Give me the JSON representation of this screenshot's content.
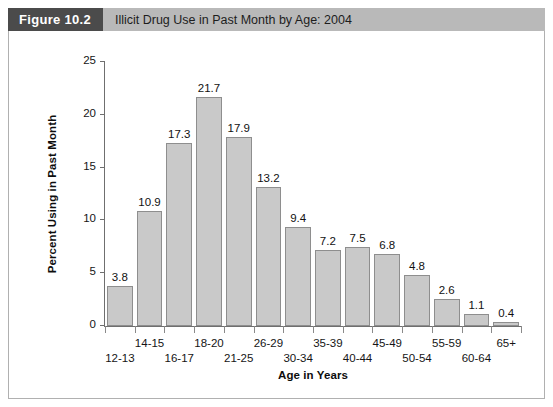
{
  "figure": {
    "tag": "Figure 10.2",
    "caption": "Illicit Drug Use in Past Month by Age: 2004"
  },
  "colors": {
    "tag_background": "#4b4b4b",
    "caption_background": "#b9b9b9",
    "bar_fill": "#c9c9c9",
    "bar_outline": "#8e8e8e",
    "axis": "#6f6f6f",
    "frame_border": "#b0b0b0"
  },
  "chart_data": {
    "type": "bar",
    "title": "Illicit Drug Use in Past Month by Age: 2004",
    "xlabel": "Age in Years",
    "ylabel": "Percent Using in Past Month",
    "ylim": [
      0,
      25
    ],
    "yticks": [
      0,
      5,
      10,
      15,
      20,
      25
    ],
    "ytick_labels": [
      "0",
      "5",
      "10",
      "15",
      "20",
      "25"
    ],
    "grid": false,
    "legend": "none",
    "categories": [
      "12-13",
      "14-15",
      "16-17",
      "18-20",
      "21-25",
      "26-29",
      "30-34",
      "35-39",
      "40-44",
      "45-49",
      "50-54",
      "55-59",
      "60-64",
      "65+"
    ],
    "values": [
      3.8,
      10.9,
      17.3,
      21.7,
      17.9,
      13.2,
      9.4,
      7.2,
      7.5,
      6.8,
      4.8,
      2.6,
      1.1,
      0.4
    ],
    "value_labels": [
      "3.8",
      "10.9",
      "17.3",
      "21.7",
      "17.9",
      "13.2",
      "9.4",
      "7.2",
      "7.5",
      "6.8",
      "4.8",
      "2.6",
      "1.1",
      "0.4"
    ]
  }
}
